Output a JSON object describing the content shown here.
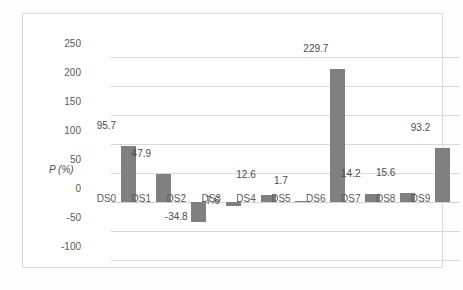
{
  "chart_data": {
    "type": "bar",
    "title": "",
    "subtitle": "",
    "xlabel": "",
    "ylabel": "P (%)",
    "categories": [
      "DS0",
      "DS1",
      "DS2",
      "DS3",
      "DS4",
      "DS5",
      "DS6",
      "DS7",
      "DS8",
      "DS9"
    ],
    "values": [
      95.7,
      47.9,
      -34.8,
      -7.6,
      12.6,
      1.7,
      229.7,
      14.2,
      15.6,
      93.2
    ],
    "data_labels": [
      "95.7",
      "47.9",
      "-34.8",
      "-7.6",
      "12.6",
      "1.7",
      "229.7",
      "14.2",
      "15.6",
      "93.2"
    ],
    "ylim": [
      -100,
      250
    ],
    "yticks": [
      250,
      200,
      150,
      100,
      50,
      0,
      -50,
      -100
    ],
    "ytick_labels": [
      "250",
      "200",
      "150",
      "100",
      "50",
      "0",
      "-50",
      "-100"
    ],
    "grid": true,
    "legend": false,
    "legend_position": "none",
    "series": [
      {
        "name": "P (%)",
        "values": [
          95.7,
          47.9,
          -34.8,
          -7.6,
          12.6,
          1.7,
          229.7,
          14.2,
          15.6,
          93.2
        ]
      }
    ],
    "colors": {
      "bar": "#808080",
      "gridline": "#d9d9d9",
      "frame_border": "#d9d9d9",
      "text": "#5a5a5a",
      "plot_background": "#ffffff"
    }
  }
}
